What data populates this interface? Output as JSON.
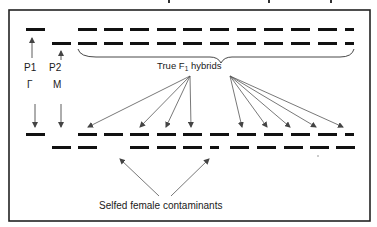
{
  "labels": {
    "p1": "P1",
    "p2": "P2",
    "p1_sex": "Γ",
    "p2_sex": "M",
    "true_f1_prefix": "True F",
    "true_f1_sub": "1",
    "true_f1_suffix": " hybrids",
    "contaminants": "Selfed female contaminants"
  },
  "colors": {
    "band": "#111111",
    "arrow": "#555555",
    "border": "#222222"
  }
}
